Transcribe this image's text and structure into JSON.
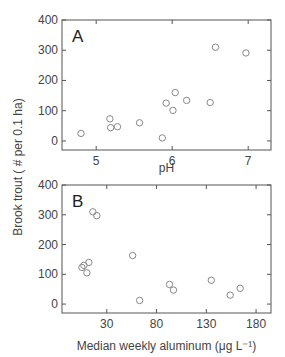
{
  "chart_data": [
    {
      "type": "scatter",
      "panel_label": "A",
      "xlabel": "pH",
      "ylabel": "Brook trout ( # per 0.1 ha)",
      "xlim": [
        4.55,
        7.3
      ],
      "ylim": [
        -30,
        400
      ],
      "xticks": [
        5,
        6,
        7
      ],
      "yticks": [
        0,
        100,
        200,
        300,
        400
      ],
      "grid": false,
      "marker": "open-circle",
      "points": [
        {
          "x": 4.8,
          "y": 25
        },
        {
          "x": 5.18,
          "y": 73
        },
        {
          "x": 5.19,
          "y": 44
        },
        {
          "x": 5.28,
          "y": 47
        },
        {
          "x": 5.57,
          "y": 60
        },
        {
          "x": 5.87,
          "y": 10
        },
        {
          "x": 5.92,
          "y": 125
        },
        {
          "x": 6.01,
          "y": 101
        },
        {
          "x": 6.04,
          "y": 160
        },
        {
          "x": 6.19,
          "y": 134
        },
        {
          "x": 6.5,
          "y": 127
        },
        {
          "x": 6.57,
          "y": 310
        },
        {
          "x": 6.97,
          "y": 291
        }
      ]
    },
    {
      "type": "scatter",
      "panel_label": "B",
      "xlabel": "Median weekly aluminum (μg L⁻¹)",
      "ylabel": "Brook trout ( # per 0.1 ha)",
      "xlim": [
        -15,
        195
      ],
      "ylim": [
        -30,
        400
      ],
      "xticks": [
        30,
        80,
        130,
        180
      ],
      "yticks": [
        0,
        100,
        200,
        300,
        400
      ],
      "grid": false,
      "marker": "open-circle",
      "points": [
        {
          "x": 5,
          "y": 123
        },
        {
          "x": 7,
          "y": 130
        },
        {
          "x": 10,
          "y": 105
        },
        {
          "x": 12,
          "y": 140
        },
        {
          "x": 16,
          "y": 310
        },
        {
          "x": 20,
          "y": 297
        },
        {
          "x": 56,
          "y": 163
        },
        {
          "x": 63,
          "y": 12
        },
        {
          "x": 93,
          "y": 66
        },
        {
          "x": 97,
          "y": 47
        },
        {
          "x": 135,
          "y": 80
        },
        {
          "x": 154,
          "y": 30
        },
        {
          "x": 164,
          "y": 53
        }
      ]
    }
  ],
  "shared_ylabel": "Brook trout ( # per 0.1 ha)"
}
